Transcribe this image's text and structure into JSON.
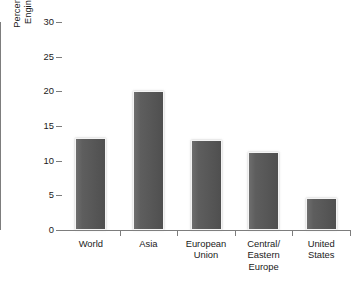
{
  "chart_data": {
    "type": "bar",
    "title": "",
    "xlabel": "",
    "ylabel": "Percentage of First University Degrees in Engineering, 2004 or Most Recent Year",
    "ylabel_lines": [
      "Percentage of First University Degrees in",
      "Engineering, 2004 or Most Recent Year"
    ],
    "categories": [
      "World",
      "Asia",
      "European Union",
      "Central/Eastern Europe",
      "United States"
    ],
    "category_lines": [
      [
        "World"
      ],
      [
        "Asia"
      ],
      [
        "European",
        "Union"
      ],
      [
        "Central/",
        "Eastern",
        "Europe"
      ],
      [
        "United",
        "States"
      ]
    ],
    "values": [
      13.3,
      20.1,
      13.0,
      11.3,
      4.6
    ],
    "ylim": [
      0,
      30
    ],
    "yticks": [
      0,
      5,
      10,
      15,
      20,
      25,
      30
    ],
    "ytick_labels": [
      "0",
      "5",
      "10",
      "15",
      "20",
      "25",
      "30"
    ],
    "grid": false,
    "legend": null,
    "bar_color": "#585858",
    "bar_edge_color": "#f4f4f4",
    "axis_color": "#7d7d7d",
    "text_color": "#1a1a1a",
    "background": "#ffffff"
  }
}
